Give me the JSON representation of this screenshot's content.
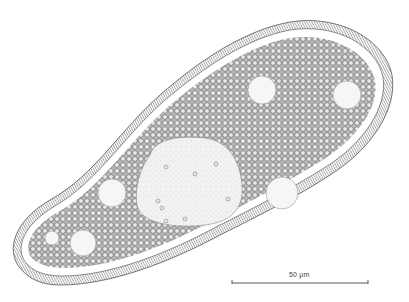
{
  "figure": {
    "background_color": "#ffffff",
    "ink_color": "#2a2a2a",
    "granule_color": "#8a8a8a",
    "vacuole_fill": "#f4f4f4",
    "nucleus_fill": "#eeeeee"
  },
  "scale_bar": {
    "label": "50 μm",
    "x1": 232,
    "x2": 368,
    "y": 283
  },
  "vacuoles": [
    {
      "cx": 262,
      "cy": 90,
      "r": 14
    },
    {
      "cx": 347,
      "cy": 95,
      "r": 14
    },
    {
      "cx": 282,
      "cy": 193,
      "r": 16
    },
    {
      "cx": 112,
      "cy": 193,
      "r": 14
    },
    {
      "cx": 83,
      "cy": 243,
      "r": 13
    },
    {
      "cx": 52,
      "cy": 238,
      "r": 7
    }
  ]
}
